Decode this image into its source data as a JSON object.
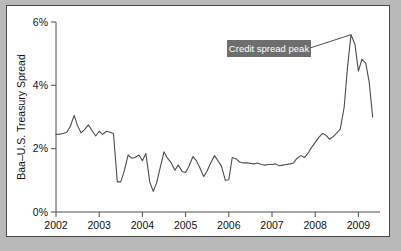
{
  "figure": {
    "page_background": "#b9b9b9",
    "panel_background": "#ffffff",
    "panel_border_color": "#4a4a4a"
  },
  "chart_data": {
    "type": "line",
    "title": "",
    "subtitle": "",
    "xlabel": "",
    "ylabel": "Baa–U.S. Treasury Spread",
    "xlim": [
      2002.0,
      2009.5
    ],
    "ylim": [
      0,
      6
    ],
    "grid": false,
    "legend": null,
    "legend_position": "none",
    "line_color": "#4d4d4d",
    "line_width_px": 1.1,
    "y_ticks": [
      0,
      2,
      4,
      6
    ],
    "y_tick_labels": [
      "0%",
      "2%",
      "4%",
      "6%"
    ],
    "x_ticks": [
      2002,
      2003,
      2004,
      2005,
      2006,
      2007,
      2008,
      2009
    ],
    "x_tick_labels": [
      "2002",
      "2003",
      "2004",
      "2005",
      "2006",
      "2007",
      "2008",
      "2009"
    ],
    "series": [
      {
        "name": "Baa–U.S. Treasury Spread",
        "x": [
          2002.0,
          2002.08,
          2002.17,
          2002.25,
          2002.33,
          2002.42,
          2002.5,
          2002.58,
          2002.67,
          2002.75,
          2002.83,
          2002.92,
          2003.0,
          2003.08,
          2003.17,
          2003.25,
          2003.33,
          2003.42,
          2003.5,
          2003.58,
          2003.67,
          2003.75,
          2003.83,
          2003.92,
          2004.0,
          2004.08,
          2004.17,
          2004.25,
          2004.33,
          2004.42,
          2004.5,
          2004.58,
          2004.67,
          2004.75,
          2004.83,
          2004.92,
          2005.0,
          2005.08,
          2005.17,
          2005.25,
          2005.33,
          2005.42,
          2005.5,
          2005.58,
          2005.67,
          2005.75,
          2005.83,
          2005.92,
          2006.0,
          2006.08,
          2006.17,
          2006.25,
          2006.33,
          2006.42,
          2006.5,
          2006.58,
          2006.67,
          2006.75,
          2006.83,
          2006.92,
          2007.0,
          2007.08,
          2007.17,
          2007.25,
          2007.33,
          2007.42,
          2007.5,
          2007.58,
          2007.67,
          2007.75,
          2007.83,
          2007.92,
          2008.0,
          2008.08,
          2008.17,
          2008.25,
          2008.33,
          2008.42,
          2008.5,
          2008.58,
          2008.67,
          2008.75,
          2008.83,
          2008.92,
          2009.0,
          2009.08,
          2009.17,
          2009.25,
          2009.33
        ],
        "values": [
          2.45,
          2.46,
          2.48,
          2.52,
          2.7,
          3.05,
          2.72,
          2.5,
          2.62,
          2.75,
          2.58,
          2.4,
          2.55,
          2.45,
          2.55,
          2.52,
          2.48,
          0.95,
          0.95,
          1.3,
          1.8,
          1.7,
          1.72,
          1.8,
          1.62,
          1.85,
          0.95,
          0.65,
          0.92,
          1.45,
          1.9,
          1.7,
          1.55,
          1.32,
          1.48,
          1.28,
          1.25,
          1.45,
          1.75,
          1.62,
          1.4,
          1.12,
          1.3,
          1.55,
          1.78,
          1.62,
          1.45,
          1.0,
          1.02,
          1.72,
          1.68,
          1.58,
          1.55,
          1.55,
          1.54,
          1.52,
          1.55,
          1.5,
          1.48,
          1.5,
          1.5,
          1.52,
          1.46,
          1.48,
          1.5,
          1.52,
          1.55,
          1.7,
          1.78,
          1.72,
          1.85,
          2.05,
          2.2,
          2.35,
          2.48,
          2.42,
          2.3,
          2.38,
          2.5,
          2.62,
          3.3,
          4.6,
          5.6,
          5.3,
          4.45,
          4.82,
          4.7,
          4.1,
          3.0
        ]
      }
    ],
    "annotations": [
      {
        "label": "Credit spread peak",
        "box_color": "#6e6e6e",
        "text_color": "#ffffff",
        "points_to_x": 2008.83,
        "points_to_y": 5.6
      }
    ]
  }
}
